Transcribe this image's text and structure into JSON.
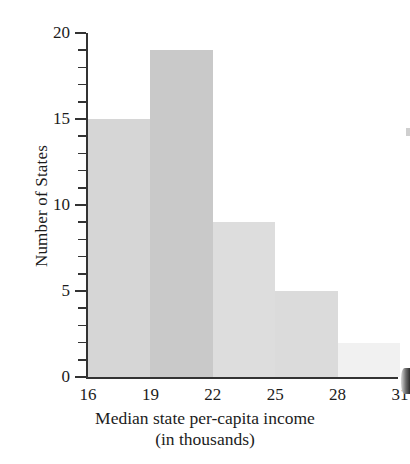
{
  "chart_data": {
    "type": "bar",
    "title": "",
    "xlabel": "Median state per-capita income",
    "xlabel_line2": "(in thousands)",
    "ylabel": "Number of States",
    "categories": [
      "16-19",
      "19-22",
      "22-25",
      "25-28",
      "28-31"
    ],
    "bin_edges": [
      16,
      19,
      22,
      25,
      28,
      31
    ],
    "values": [
      15,
      19,
      9,
      5,
      2
    ],
    "xlim": [
      16,
      31
    ],
    "ylim": [
      0,
      20
    ],
    "x_tick_labels": [
      "16",
      "19",
      "22",
      "25",
      "28",
      "31"
    ],
    "y_tick_labels": [
      "0",
      "5",
      "10",
      "15",
      "20"
    ],
    "y_major_ticks": [
      0,
      5,
      10,
      15,
      20
    ],
    "y_minor_ticks": [
      1,
      2,
      3,
      4,
      6,
      7,
      8,
      9,
      11,
      12,
      13,
      14,
      16,
      17,
      18,
      19
    ],
    "grid": false,
    "legend": null,
    "bar_colors": [
      "#d6d6d6",
      "#c9c9c9",
      "#dddddd",
      "#dbdbdb",
      "#f1f1f1"
    ],
    "axis_color": "#333333"
  },
  "axes": {
    "y_label": "Number of States"
  },
  "caption": {
    "line1": "Median state per-capita income",
    "line2": "(in thousands)"
  }
}
